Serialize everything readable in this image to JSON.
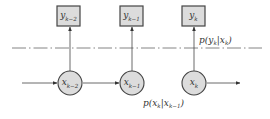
{
  "diagram": {
    "type": "hidden-markov-model",
    "colors": {
      "stroke": "#444444",
      "node_fill": "#dcdcdc",
      "box_fill": "#dcdcdc",
      "text": "#333333",
      "background": "#ffffff"
    },
    "observations": [
      {
        "id": "y_km2",
        "base": "y",
        "sub": "k−2",
        "x": 57,
        "y": 6,
        "w": 23,
        "h": 20
      },
      {
        "id": "y_km1",
        "base": "y",
        "sub": "k−1",
        "x": 120,
        "y": 6,
        "w": 23,
        "h": 20
      },
      {
        "id": "y_k",
        "base": "y",
        "sub": "k",
        "x": 182,
        "y": 6,
        "w": 23,
        "h": 20
      }
    ],
    "states": [
      {
        "id": "x_km2",
        "base": "x",
        "sub": "k−2",
        "cx": 70,
        "cy": 83,
        "r": 12
      },
      {
        "id": "x_km1",
        "base": "x",
        "sub": "k−1",
        "cx": 132,
        "cy": 83,
        "r": 12
      },
      {
        "id": "x_k",
        "base": "x",
        "sub": "k",
        "cx": 194,
        "cy": 83,
        "r": 12
      }
    ],
    "separator": {
      "style": "dash-dot",
      "y": 48,
      "x1": 12,
      "x2": 262
    },
    "emission_label": {
      "text_p": "p(",
      "base1": "y",
      "sub1": "k",
      "bar": "|",
      "base2": "x",
      "sub2": "k",
      "close": ")",
      "x": 199,
      "y": 43
    },
    "transition_label": {
      "text_p": "p(",
      "base1": "x",
      "sub1": "k",
      "bar": "|",
      "base2": "x",
      "sub2": "k−1",
      "close": ")",
      "x": 143,
      "y": 106
    },
    "transition_arrows": [
      {
        "x1": 22,
        "x2": 57
      },
      {
        "x1": 83,
        "x2": 119
      },
      {
        "x1": 207,
        "x2": 240
      }
    ]
  }
}
